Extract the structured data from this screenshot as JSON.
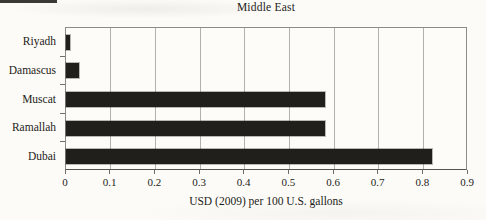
{
  "chart": {
    "title": "Middle East",
    "xlabel": "USD (2009) per 100 U.S. gallons"
  },
  "chart_data": {
    "type": "bar",
    "orientation": "horizontal",
    "title": "Middle East",
    "xlabel": "USD (2009) per 100 U.S. gallons",
    "ylabel": "",
    "categories": [
      "Riyadh",
      "Damascus",
      "Muscat",
      "Ramallah",
      "Dubai"
    ],
    "values": [
      0.01,
      0.03,
      0.58,
      0.58,
      0.82
    ],
    "xlim": [
      0,
      0.9
    ],
    "xticks": [
      0,
      0.1,
      0.2,
      0.3,
      0.4,
      0.5,
      0.6,
      0.7,
      0.8,
      0.9
    ],
    "xtick_labels": [
      "0",
      "0.1",
      "0.2",
      "0.3",
      "0.4",
      "0.5",
      "0.6",
      "0.7",
      "0.8",
      "0.9"
    ],
    "grid": true,
    "legend": false,
    "bar_color": "#201f1c",
    "background_color": "#fcfbf7",
    "gridline_color": "#b3b1ac"
  }
}
